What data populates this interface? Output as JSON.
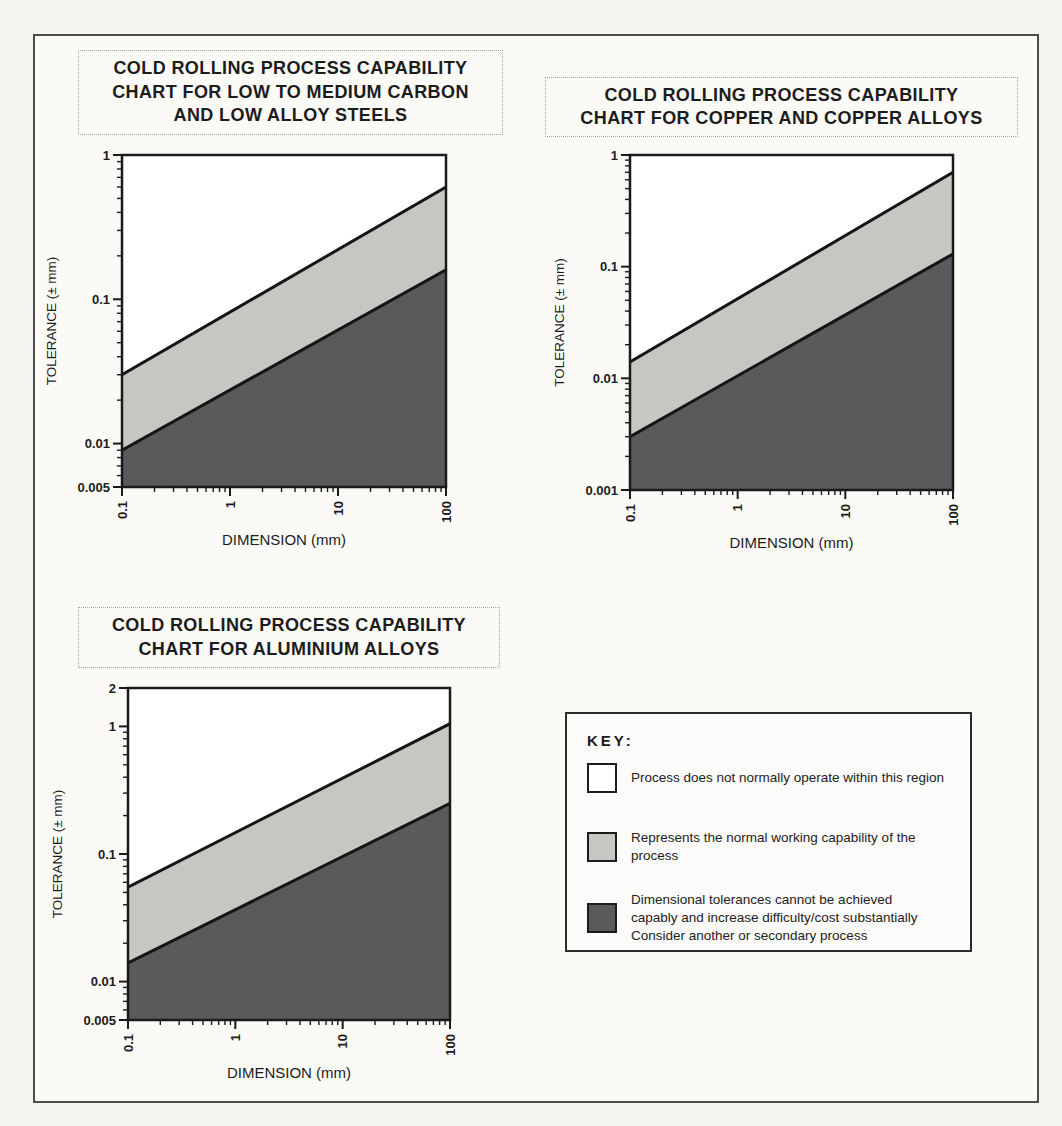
{
  "page": {
    "background": "#f6f5f2",
    "frame_color": "#4b4b4b"
  },
  "colors": {
    "region_above": "#ffffff",
    "region_normal": "#c7c6c3",
    "region_below": "#5a595c",
    "boundary_line": "#151515",
    "axis": "#1a1a1a",
    "text": "#1f1f1f"
  },
  "key": {
    "title": "KEY:",
    "items": [
      {
        "swatch_color": "#ffffff",
        "label_lines": [
          "Process does not normally operate within this region"
        ]
      },
      {
        "swatch_color": "#c7c6c3",
        "label_lines": [
          "Represents the normal working capability of the",
          "process"
        ]
      },
      {
        "swatch_color": "#5a595c",
        "label_lines": [
          "Dimensional tolerances cannot be achieved",
          "capably and increase difficulty/cost substantially",
          "Consider another or secondary process"
        ]
      }
    ]
  },
  "chart_data": [
    {
      "id": "steels",
      "type": "area",
      "title_lines": [
        "COLD ROLLING PROCESS CAPABILITY",
        "CHART FOR LOW TO MEDIUM CARBON",
        "AND LOW ALLOY STEELS"
      ],
      "xlabel": "DIMENSION (mm)",
      "ylabel": "TOLERANCE (± mm)",
      "x_scale": "log",
      "y_scale": "log",
      "xlim": [
        0.1,
        100
      ],
      "ylim": [
        0.005,
        1
      ],
      "x_ticks": [
        {
          "value": 0.1,
          "label": "0.1"
        },
        {
          "value": 1,
          "label": "1"
        },
        {
          "value": 10,
          "label": "10"
        },
        {
          "value": 100,
          "label": "100"
        }
      ],
      "y_ticks": [
        {
          "value": 1,
          "label": "1"
        },
        {
          "value": 0.1,
          "label": "0.1"
        },
        {
          "value": 0.01,
          "label": "0.01"
        },
        {
          "value": 0.005,
          "label": "0.005"
        }
      ],
      "series": [
        {
          "name": "normal_capability_upper_bound",
          "x": [
            0.1,
            100
          ],
          "y": [
            0.03,
            0.6
          ]
        },
        {
          "name": "normal_capability_lower_bound",
          "x": [
            0.1,
            100
          ],
          "y": [
            0.009,
            0.16
          ]
        }
      ],
      "regions": {
        "above_upper_line": "Process does not normally operate within this region",
        "between_lines": "Represents the normal working capability of the process",
        "below_lower_line": "Dimensional tolerances cannot be achieved capably"
      },
      "grid": false,
      "legend_position": "none"
    },
    {
      "id": "copper",
      "type": "area",
      "title_lines": [
        "COLD ROLLING PROCESS CAPABILITY",
        "CHART FOR COPPER AND COPPER ALLOYS"
      ],
      "xlabel": "DIMENSION (mm)",
      "ylabel": "TOLERANCE (± mm)",
      "x_scale": "log",
      "y_scale": "log",
      "xlim": [
        0.1,
        100
      ],
      "ylim": [
        0.001,
        1
      ],
      "x_ticks": [
        {
          "value": 0.1,
          "label": "0.1"
        },
        {
          "value": 1,
          "label": "1"
        },
        {
          "value": 10,
          "label": "10"
        },
        {
          "value": 100,
          "label": "100"
        }
      ],
      "y_ticks": [
        {
          "value": 1,
          "label": "1"
        },
        {
          "value": 0.1,
          "label": "0.1"
        },
        {
          "value": 0.01,
          "label": "0.01"
        },
        {
          "value": 0.001,
          "label": "0.001"
        }
      ],
      "series": [
        {
          "name": "normal_capability_upper_bound",
          "x": [
            0.1,
            100
          ],
          "y": [
            0.014,
            0.7
          ]
        },
        {
          "name": "normal_capability_lower_bound",
          "x": [
            0.1,
            100
          ],
          "y": [
            0.003,
            0.13
          ]
        }
      ],
      "regions": {
        "above_upper_line": "Process does not normally operate within this region",
        "between_lines": "Represents the normal working capability of the process",
        "below_lower_line": "Dimensional tolerances cannot be achieved capably"
      },
      "grid": false,
      "legend_position": "none"
    },
    {
      "id": "aluminium",
      "type": "area",
      "title_lines": [
        "COLD ROLLING PROCESS CAPABILITY",
        "CHART FOR ALUMINIUM ALLOYS"
      ],
      "xlabel": "DIMENSION (mm)",
      "ylabel": "TOLERANCE (± mm)",
      "x_scale": "log",
      "y_scale": "log",
      "xlim": [
        0.1,
        100
      ],
      "ylim": [
        0.005,
        2
      ],
      "x_ticks": [
        {
          "value": 0.1,
          "label": "0.1"
        },
        {
          "value": 1,
          "label": "1"
        },
        {
          "value": 10,
          "label": "10"
        },
        {
          "value": 100,
          "label": "100"
        }
      ],
      "y_ticks": [
        {
          "value": 2,
          "label": "2"
        },
        {
          "value": 1,
          "label": "1"
        },
        {
          "value": 0.1,
          "label": "0.1"
        },
        {
          "value": 0.01,
          "label": "0.01"
        },
        {
          "value": 0.005,
          "label": "0.005"
        }
      ],
      "series": [
        {
          "name": "normal_capability_upper_bound",
          "x": [
            0.1,
            100
          ],
          "y": [
            0.055,
            1.05
          ]
        },
        {
          "name": "normal_capability_lower_bound",
          "x": [
            0.1,
            100
          ],
          "y": [
            0.014,
            0.25
          ]
        }
      ],
      "regions": {
        "above_upper_line": "Process does not normally operate within this region",
        "between_lines": "Represents the normal working capability of the process",
        "below_lower_line": "Dimensional tolerances cannot be achieved capably"
      },
      "grid": false,
      "legend_position": "none"
    }
  ]
}
